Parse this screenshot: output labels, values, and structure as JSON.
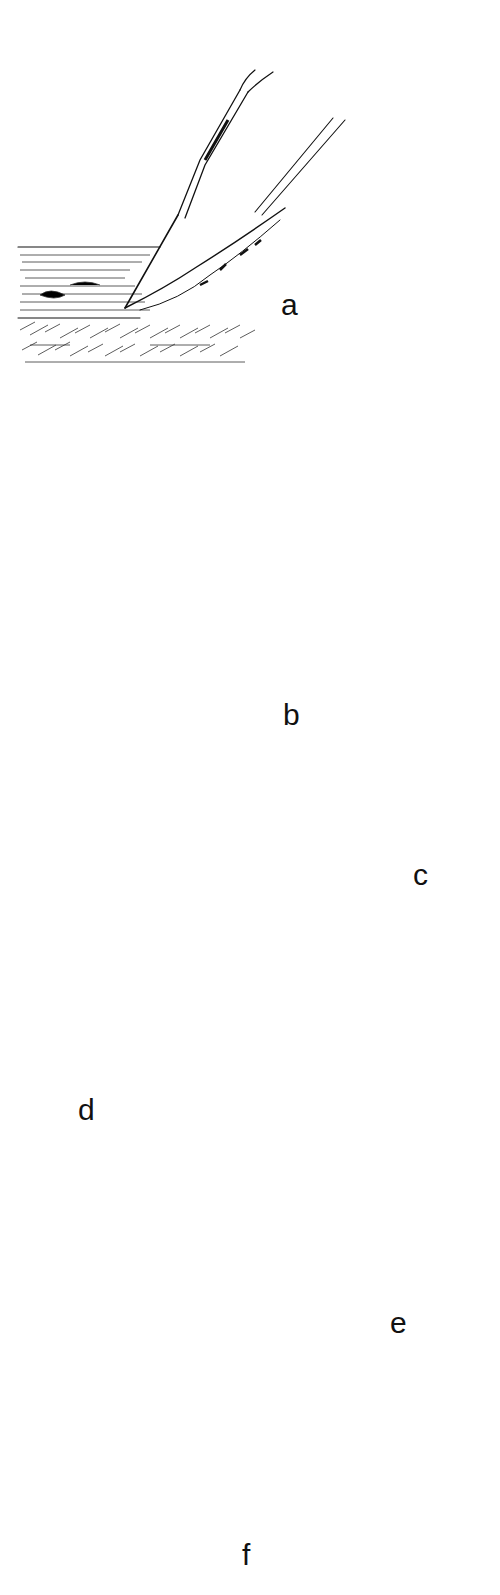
{
  "figure": {
    "type": "surgical-technique-illustration",
    "panels": [
      {
        "id": "a",
        "label": "a",
        "content": "Tissue layers with needle and probe instruments; lifting tissue edge"
      },
      {
        "id": "b",
        "label": "b",
        "content": "Scalpel undermining tissue; two deep sutures with dashed suture paths in tissue cross-sections"
      },
      {
        "id": "c",
        "label": "c",
        "content": "Interrupted sutures across wound edge (cross-section and surface view with 5 stitches)"
      },
      {
        "id": "d",
        "label": "d",
        "content": "Wound edge with inverted tissue; sutures in cross-section and surface view with 4 stitches"
      },
      {
        "id": "e",
        "label": "e",
        "content": "Deep suture loop (dashed) through tissue; surface view with 5 stitches"
      },
      {
        "id": "f",
        "label": "f",
        "content": "Curved needle passing through skin; needle withdrawn with arrow indicating direction"
      }
    ],
    "labels": {
      "a": "a",
      "b": "b",
      "c": "c",
      "d": "d",
      "e": "e",
      "f": "f"
    }
  }
}
